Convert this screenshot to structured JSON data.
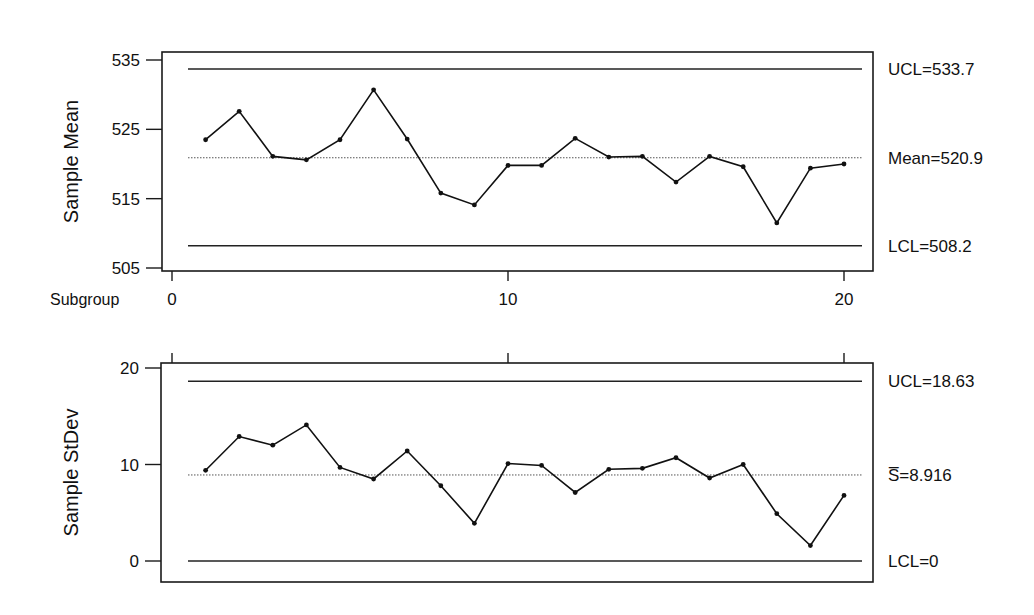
{
  "chart_data": [
    {
      "type": "line",
      "title": "",
      "subtitle": "Xbar chart",
      "xlabel": "Subgroup",
      "ylabel": "Sample Mean",
      "x": [
        1,
        2,
        3,
        4,
        5,
        6,
        7,
        8,
        9,
        10,
        11,
        12,
        13,
        14,
        15,
        16,
        17,
        18,
        19,
        20
      ],
      "series": [
        {
          "name": "Sample Mean",
          "values": [
            523.5,
            527.6,
            521.1,
            520.6,
            523.5,
            530.7,
            523.6,
            515.8,
            514.1,
            519.8,
            519.8,
            523.7,
            521.0,
            521.1,
            517.4,
            521.1,
            519.6,
            511.5,
            519.4,
            520.0
          ]
        }
      ],
      "reference_lines": [
        {
          "name": "UCL",
          "value": 533.7,
          "label": "UCL=533.7",
          "style": "solid"
        },
        {
          "name": "Mean",
          "value": 520.9,
          "label": "Mean=520.9",
          "style": "dotted"
        },
        {
          "name": "LCL",
          "value": 508.2,
          "label": "LCL=508.2",
          "style": "solid"
        }
      ],
      "yticks": [
        505,
        515,
        525,
        535
      ],
      "ytick_labels": [
        "505",
        "515",
        "525",
        "535"
      ],
      "xticks": [
        0,
        10,
        20
      ],
      "xtick_labels": [
        "0",
        "10",
        "20"
      ],
      "ylim": [
        505,
        535
      ],
      "xlim": [
        0,
        21
      ],
      "grid": false,
      "legend": "none"
    },
    {
      "type": "line",
      "title": "",
      "subtitle": "S chart",
      "xlabel": "",
      "ylabel": "Sample StDev",
      "x": [
        1,
        2,
        3,
        4,
        5,
        6,
        7,
        8,
        9,
        10,
        11,
        12,
        13,
        14,
        15,
        16,
        17,
        18,
        19,
        20
      ],
      "series": [
        {
          "name": "Sample StDev",
          "values": [
            9.4,
            12.9,
            12.0,
            14.1,
            9.7,
            8.5,
            11.4,
            7.8,
            3.9,
            10.1,
            9.9,
            7.1,
            9.5,
            9.6,
            10.7,
            8.6,
            10.0,
            4.9,
            1.6,
            6.8
          ]
        }
      ],
      "reference_lines": [
        {
          "name": "UCL",
          "value": 18.63,
          "label": "UCL=18.63",
          "style": "solid"
        },
        {
          "name": "S-bar",
          "value": 8.916,
          "label": "S̅=8.916",
          "style": "dotted"
        },
        {
          "name": "LCL",
          "value": 0,
          "label": "LCL=0",
          "style": "solid"
        }
      ],
      "yticks": [
        0,
        10,
        20
      ],
      "ytick_labels": [
        "0",
        "10",
        "20"
      ],
      "xticks": [
        0,
        10,
        20
      ],
      "xtick_labels": [],
      "ylim": [
        0,
        20
      ],
      "xlim": [
        0,
        21
      ],
      "grid": false,
      "legend": "none"
    }
  ],
  "layout": {
    "panels": [
      {
        "frame": {
          "left": 162,
          "top": 52,
          "right": 873,
          "bottom": 271
        },
        "y_px": {
          "v0": 505,
          "p0": 268,
          "v1": 535,
          "p1": 60
        },
        "x_ticks_side": "bottom",
        "line_x": [
          188,
          862
        ]
      },
      {
        "frame": {
          "left": 161,
          "top": 363,
          "right": 873,
          "bottom": 582
        },
        "y_px": {
          "v0": 0,
          "p0": 561,
          "v1": 20,
          "p1": 368
        },
        "x_ticks_side": "top",
        "line_x": [
          188,
          862
        ]
      }
    ],
    "x_px": {
      "v0": 0,
      "p0": 172,
      "v1": 20,
      "p1": 844
    }
  }
}
